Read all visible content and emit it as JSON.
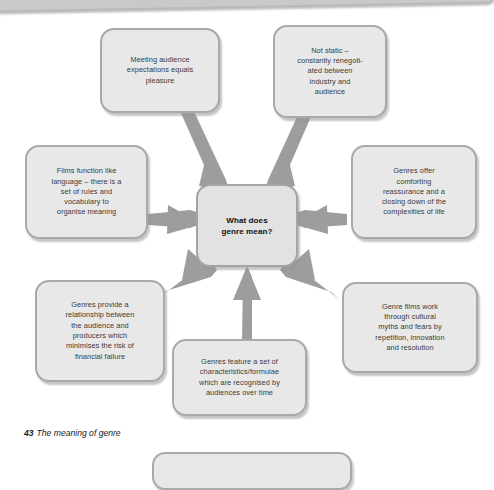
{
  "figure": {
    "caption_number": "43",
    "caption_title": "The meaning of genre"
  },
  "diagram": {
    "type": "hub-and-spoke mind map",
    "center": {
      "id": "center",
      "label": "What does\ngenre mean?",
      "plain": "What does genre mean?"
    },
    "nodes": [
      {
        "id": "meeting-audience-expectations",
        "position": "top-left",
        "label": "Meeting audience\nexpectations equals\npleasure",
        "plain": "Meeting audience expectations equals pleasure"
      },
      {
        "id": "not-static",
        "position": "top-right",
        "label": "Not static –\nconstantly renegoti-\nated between\nindustry and\naudience",
        "plain": "Not static – constantly renegotiated between industry and audience"
      },
      {
        "id": "films-function-like-language",
        "position": "left",
        "label": "Films function like\nlanguage – there is a\nset of rules and\nvocabulary to\norganise meaning",
        "plain": "Films function like language – there is a set of rules and vocabulary to organise meaning"
      },
      {
        "id": "genres-offer-comforting-reassurance",
        "position": "right",
        "label": "Genres offer\ncomforting\nreassurance and a\nclosing down of the\ncomplexities of life",
        "plain": "Genres offer comforting reassurance and a closing down of the complexities of life"
      },
      {
        "id": "genres-provide-a-relationship",
        "position": "bottom-left",
        "label": "Genres provide a\nrelationship between\nthe audience and\nproducers which\nminimises the risk of\nfinancial failure",
        "plain": "Genres provide a relationship between the audience and producers which minimises the risk of financial failure"
      },
      {
        "id": "genres-feature-a-set-of-characteristics",
        "position": "bottom-center",
        "label": "Genres feature a set of\ncharacteristics/formulae\nwhich are recognised by\naudiences over time",
        "plain": "Genres feature a set of characteristics/formulae which are recognised by audiences over time"
      },
      {
        "id": "genre-films-work-through-cultural-myths",
        "position": "bottom-right",
        "label": "Genre films work\nthrough cultural\nmyths and fears by\nrepetition, innovation\nand resolution",
        "plain": "Genre films work through cultural myths and fears by repetition, innovation and resolution"
      }
    ],
    "colors": {
      "node_fill": "#e8e8e8",
      "node_border": "#a9a9a9",
      "connector": "#9d9d9d",
      "text": "#3a3a3a",
      "center_text": "#111111",
      "page_bar": "#c9c9c9",
      "background": "#ffffff"
    }
  }
}
